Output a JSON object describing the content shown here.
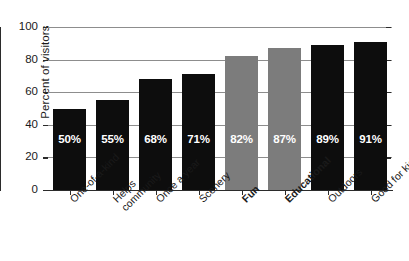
{
  "chart_data": {
    "type": "bar",
    "title": "",
    "xlabel": "",
    "ylabel": "Percent of visitors",
    "ylim": [
      0,
      100
    ],
    "yticks": [
      0,
      20,
      40,
      60,
      80,
      100
    ],
    "grid": true,
    "legend": null,
    "categories": [
      "One-of-a-kind",
      "Helps community",
      "Once a year",
      "Scenery",
      "Fun",
      "Educational",
      "Outdoors",
      "Good for kids"
    ],
    "values": [
      50,
      55,
      68,
      71,
      82,
      87,
      89,
      91
    ],
    "data_labels": [
      "50%",
      "55%",
      "68%",
      "71%",
      "82%",
      "87%",
      "89%",
      "91%"
    ],
    "bar_colors": [
      "#0d0d0d",
      "#0d0d0d",
      "#0d0d0d",
      "#0d0d0d",
      "#7c7c7c",
      "#7c7c7c",
      "#0d0d0d",
      "#0d0d0d"
    ],
    "highlighted_categories": [
      "Fun",
      "Educational"
    ]
  },
  "axis": {
    "y_title": "Percent of visitors",
    "y_tick_labels": [
      "100",
      "80",
      "60",
      "40",
      "20",
      "0"
    ]
  },
  "categories_display": [
    {
      "line1": "One-of-a-kind",
      "line2": "",
      "bold": false
    },
    {
      "line1": "Helps",
      "line2": "community",
      "bold": false
    },
    {
      "line1": "Once a year",
      "line2": "",
      "bold": false
    },
    {
      "line1": "Scenery",
      "line2": "",
      "bold": false
    },
    {
      "line1": "Fun",
      "line2": "",
      "bold": true
    },
    {
      "line1": "Educational",
      "line2": "",
      "bold": true
    },
    {
      "line1": "Outdoors",
      "line2": "",
      "bold": false
    },
    {
      "line1": "Good for kids",
      "line2": "",
      "bold": false
    }
  ],
  "colors": {
    "bar_primary": "#0d0d0d",
    "bar_highlight": "#7c7c7c",
    "gridline": "#8d8d8d",
    "axis": "#2b2b2b",
    "label_text": "#1a1a1a",
    "value_text": "#ffffff",
    "background": "#ffffff"
  }
}
